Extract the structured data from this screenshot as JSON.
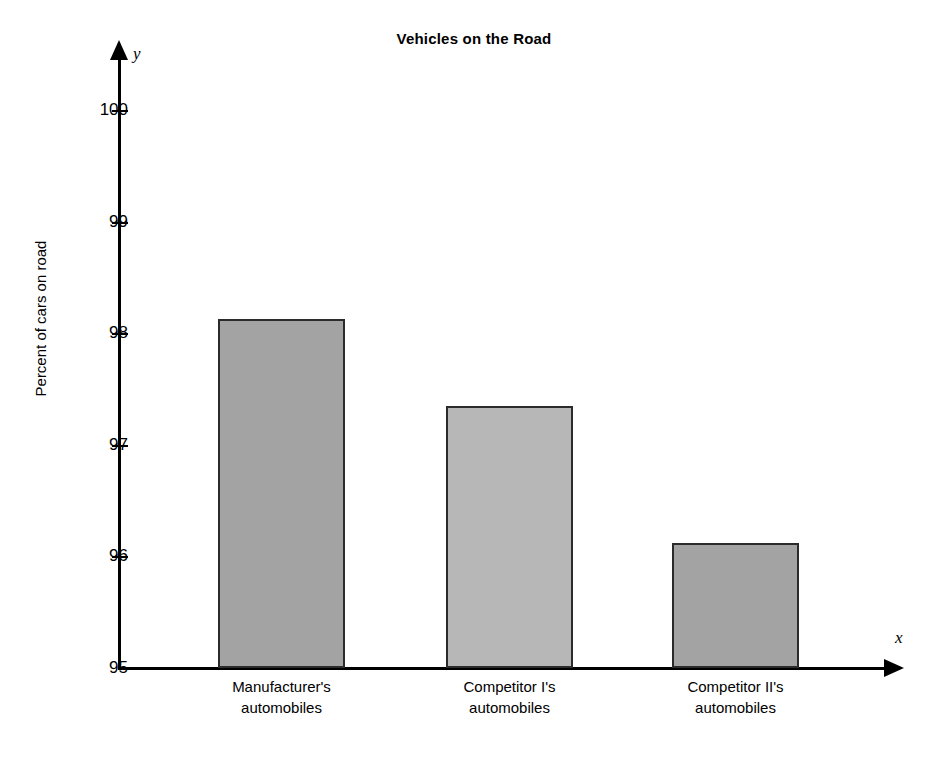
{
  "chart": {
    "title": "Vehicles on the Road",
    "y_axis_title": "Percent of cars on road",
    "x_axis_name": "x",
    "y_axis_name": "y"
  },
  "chart_data": {
    "type": "bar",
    "title": "Vehicles on the Road",
    "xlabel": "",
    "ylabel": "Percent of cars on road",
    "categories": [
      "Manufacturer's automobiles",
      "Competitor I's automobiles",
      "Competitor II's automobiles"
    ],
    "category_lines": [
      [
        "Manufacturer's",
        "automobiles"
      ],
      [
        "Competitor I's",
        "automobiles"
      ],
      [
        "Competitor II's",
        "automobiles"
      ]
    ],
    "values": [
      98.13,
      97.35,
      96.12
    ],
    "ylim": [
      95,
      100
    ],
    "yticks": [
      95,
      96,
      97,
      98,
      99,
      100
    ],
    "ytick_labels": [
      "95",
      "96",
      "97",
      "98",
      "99",
      "100"
    ],
    "grid": false,
    "legend": false,
    "bar_colors": [
      "#a3a3a3",
      "#b7b7b7",
      "#a3a3a3"
    ],
    "bar_edge_color": "#2b2b2b"
  }
}
